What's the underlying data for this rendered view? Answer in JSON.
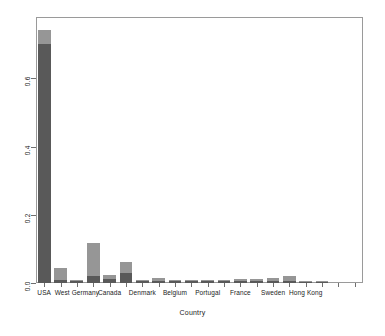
{
  "chart_data": {
    "type": "bar",
    "stacked": true,
    "title": "",
    "subtitle": "",
    "xlabel": "Country",
    "ylabel": "",
    "ylim": [
      0.0,
      0.78
    ],
    "xlim": [
      0,
      20
    ],
    "grid": false,
    "legend": null,
    "y_ticks": [
      0.0,
      0.2,
      0.4,
      0.6
    ],
    "y_tick_labels": [
      "0.0",
      "0.2",
      "0.4",
      "0.6"
    ],
    "categories": [
      "USA",
      "",
      "West Germany",
      "",
      "Canada",
      "",
      "Denmark",
      "",
      "Belgium",
      "",
      "Portugal",
      "",
      "France",
      "",
      "Sweden",
      "",
      "Hong Kong",
      "",
      "",
      ""
    ],
    "visible_tick_labels": [
      "USA",
      "West Germany",
      "Canada",
      "Denmark",
      "Belgium",
      "Portugal",
      "France",
      "Sweden",
      "Hong Kong"
    ],
    "series": [
      {
        "name": "lower",
        "color": "#595959",
        "values": [
          0.7,
          0.01,
          0.006,
          0.022,
          0.013,
          0.03,
          0.006,
          0.006,
          0.006,
          0.006,
          0.006,
          0.006,
          0.006,
          0.006,
          0.006,
          0.006,
          0.003,
          0.003,
          0.0,
          0.0
        ]
      },
      {
        "name": "upper",
        "color": "#969696",
        "values": [
          0.043,
          0.035,
          0.003,
          0.096,
          0.01,
          0.032,
          0.003,
          0.009,
          0.004,
          0.004,
          0.004,
          0.004,
          0.005,
          0.006,
          0.01,
          0.014,
          0.002,
          0.002,
          0.0,
          0.0
        ]
      }
    ],
    "totals": [
      0.743,
      0.045,
      0.009,
      0.118,
      0.023,
      0.062,
      0.009,
      0.015,
      0.01,
      0.01,
      0.01,
      0.01,
      0.011,
      0.012,
      0.016,
      0.02,
      0.005,
      0.005,
      0.0,
      0.0
    ]
  },
  "axis": {
    "x_title": "Country"
  },
  "style": {
    "frame_color": "#9a9a9a",
    "tick_color": "#6f6f6f",
    "background": "#ffffff",
    "lower_color": "#595959",
    "upper_color": "#969696"
  }
}
